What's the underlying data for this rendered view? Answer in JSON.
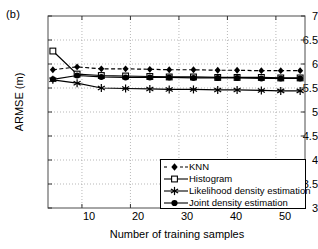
{
  "figure": {
    "panel_label": "(b)",
    "xlabel": "Number of training samples",
    "ylabel": "ARMSE (m)"
  },
  "axes": {
    "yticks": [
      "3",
      "3.5",
      "4",
      "4.5",
      "5",
      "5.5",
      "6",
      "6.5",
      "7"
    ],
    "xticks": [
      "10",
      "20",
      "30",
      "40",
      "50"
    ]
  },
  "legend": {
    "items": [
      {
        "label": "KNN",
        "marker": "diamond",
        "line": "dashed",
        "color": "#000000"
      },
      {
        "label": "Histogram",
        "marker": "square-open",
        "line": "solid",
        "color": "#000000"
      },
      {
        "label": "Likelihood density estimation",
        "marker": "asterisk",
        "line": "solid",
        "color": "#000000"
      },
      {
        "label": "Joint density estimation",
        "marker": "circle",
        "line": "solid",
        "color": "#000000"
      }
    ]
  },
  "chart_data": {
    "type": "line",
    "title": "",
    "xlabel": "Number of training samples",
    "ylabel": "ARMSE (m)",
    "xlim": [
      3,
      56
    ],
    "ylim": [
      3,
      7
    ],
    "xticks": [
      10,
      20,
      30,
      40,
      50
    ],
    "yticks": [
      3,
      3.5,
      4,
      4.5,
      5,
      5.5,
      6,
      6.5,
      7
    ],
    "grid": true,
    "legend_position": "lower right",
    "x": [
      4,
      9,
      14,
      19,
      24,
      28,
      33,
      38,
      42,
      47,
      51,
      55
    ],
    "series": [
      {
        "name": "KNN",
        "marker": "diamond",
        "linestyle": "dashed",
        "values": [
          5.88,
          5.94,
          5.9,
          5.9,
          5.89,
          5.88,
          5.88,
          5.87,
          5.87,
          5.86,
          5.86,
          5.86
        ]
      },
      {
        "name": "Histogram",
        "marker": "square-open",
        "linestyle": "solid",
        "values": [
          6.27,
          5.79,
          5.76,
          5.75,
          5.74,
          5.73,
          5.73,
          5.72,
          5.72,
          5.72,
          5.71,
          5.71
        ]
      },
      {
        "name": "Likelihood density estimation",
        "marker": "asterisk",
        "linestyle": "solid",
        "values": [
          5.67,
          5.6,
          5.5,
          5.49,
          5.48,
          5.47,
          5.47,
          5.46,
          5.46,
          5.45,
          5.44,
          5.44
        ]
      },
      {
        "name": "Joint density estimation",
        "marker": "circle",
        "linestyle": "solid",
        "values": [
          5.68,
          5.76,
          5.73,
          5.72,
          5.72,
          5.72,
          5.71,
          5.71,
          5.71,
          5.7,
          5.7,
          5.7
        ]
      }
    ]
  }
}
